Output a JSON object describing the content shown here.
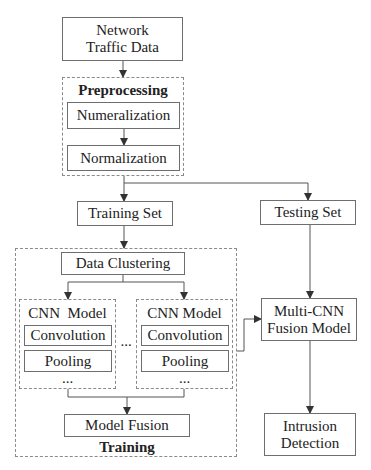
{
  "diagram": {
    "input": "Network\nTraffic Data",
    "preprocessing": {
      "title": "Preprocessing",
      "steps": [
        "Numeralization",
        "Normalization"
      ]
    },
    "training_set": "Training Set",
    "testing_set": "Testing Set",
    "training": {
      "title": "Training",
      "clustering": "Data Clustering",
      "cnn_models": [
        {
          "title": "CNN  Model",
          "layers": [
            "Convolution",
            "Pooling"
          ],
          "more": "..."
        },
        {
          "title": "CNN Model",
          "layers": [
            "Convolution",
            "Pooling"
          ],
          "more": "..."
        }
      ],
      "between_models": "...",
      "fusion": "Model Fusion"
    },
    "fusion_model": "Multi-CNN\nFusion Model",
    "output": "Intrusion\nDetection"
  }
}
